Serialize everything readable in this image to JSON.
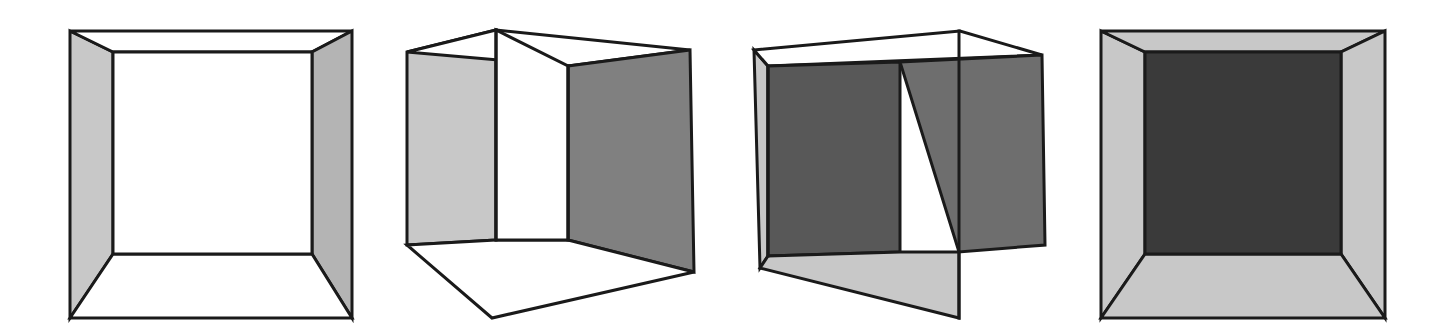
{
  "figure": {
    "background_color": "#ffffff",
    "canvas": {
      "width": 1443,
      "height": 336
    },
    "stroke_color": "#1a1a1a",
    "stroke_width": 3,
    "palette": {
      "white": "#ffffff",
      "light_gray": "#c8c8c8",
      "mid_gray": "#b4b4b4",
      "medium_gray": "#808080",
      "dark_gray": "#6e6e6e",
      "very_dark_gray": "#3a3a3a"
    }
  },
  "cubes": [
    {
      "id": "cube-1",
      "label": "Frontal open box, white back face",
      "view": "one-point-perspective-frontal",
      "bounds": {
        "x": 70,
        "y": 31,
        "width": 282,
        "height": 287
      },
      "faces": [
        {
          "name": "left-wall",
          "fill": "#c8c8c8",
          "points": "70,31 113,52 113,254 70,318"
        },
        {
          "name": "top-wall",
          "fill": "#ffffff",
          "points": "70,31 352,31 312,52 113,52"
        },
        {
          "name": "right-wall",
          "fill": "#b4b4b4",
          "points": "352,31 352,318 312,254 312,52"
        },
        {
          "name": "bottom-wall",
          "fill": "#ffffff",
          "points": "70,318 113,254 312,254 352,318"
        },
        {
          "name": "back-face",
          "fill": "#ffffff",
          "points": "113,52 312,52 312,254 113,254"
        }
      ]
    },
    {
      "id": "cube-2",
      "label": "Three-quarter box, near edge left of centre, white floor and back",
      "view": "two-point-perspective-left",
      "bounds": {
        "x": 407,
        "y": 30,
        "width": 287,
        "height": 288
      },
      "faces": [
        {
          "name": "left-wall",
          "fill": "#c8c8c8",
          "points": "407,52 496,30 496,240 407,245"
        },
        {
          "name": "top-wall",
          "fill": "#ffffff",
          "points": "496,30 690,50 568,66 407,52"
        },
        {
          "name": "right-wall",
          "fill": "#808080",
          "points": "568,66 690,50 694,272 568,240"
        },
        {
          "name": "floor",
          "fill": "#ffffff",
          "points": "407,245 496,240 568,240 694,272 492,318"
        },
        {
          "name": "back-face",
          "fill": "#ffffff",
          "points": "496,30 568,66 568,240 496,240"
        }
      ],
      "interior_edges": [
        {
          "name": "near-vertical-edge",
          "from": [
            496,
            30
          ],
          "to": [
            496,
            240
          ]
        },
        {
          "name": "back-vertical-edge",
          "from": [
            568,
            66
          ],
          "to": [
            568,
            240
          ]
        }
      ]
    },
    {
      "id": "cube-3",
      "label": "Three-quarter box mirrored, near edge right of centre, dark back face",
      "view": "two-point-perspective-right",
      "bounds": {
        "x": 754,
        "y": 31,
        "width": 291,
        "height": 287
      },
      "faces": [
        {
          "name": "left-wall",
          "fill": "#c8c8c8",
          "points": "754,50 768,66 768,256 760,268"
        },
        {
          "name": "top-wall",
          "fill": "#ffffff",
          "points": "754,50 960,31 1042,55 768,66"
        },
        {
          "name": "back-face",
          "fill": "#585858",
          "points": "768,66 900,62 900,252 768,256"
        },
        {
          "name": "right-wall",
          "fill": "#6e6e6e",
          "points": "900,62 1042,55 1045,245 959,252"
        },
        {
          "name": "floor",
          "fill": "#c8c8c8",
          "points": "760,268 768,256 900,252 959,252 959,318"
        }
      ],
      "interior_edges": [
        {
          "name": "near-vertical-edge",
          "from": [
            959,
            31
          ],
          "to": [
            959,
            318
          ]
        },
        {
          "name": "back-left-vertical-edge",
          "from": [
            768,
            66
          ],
          "to": [
            768,
            256
          ]
        }
      ]
    },
    {
      "id": "cube-4",
      "label": "Frontal open box, very dark back face, all four walls shaded",
      "view": "one-point-perspective-frontal",
      "bounds": {
        "x": 1101,
        "y": 31,
        "width": 284,
        "height": 287
      },
      "faces": [
        {
          "name": "left-wall",
          "fill": "#c8c8c8",
          "points": "1101,31 1145,52 1145,254 1101,318"
        },
        {
          "name": "top-wall",
          "fill": "#c8c8c8",
          "points": "1101,31 1385,31 1341,52 1145,52"
        },
        {
          "name": "right-wall",
          "fill": "#c8c8c8",
          "points": "1385,31 1385,318 1341,254 1341,52"
        },
        {
          "name": "bottom-wall",
          "fill": "#c8c8c8",
          "points": "1101,318 1145,254 1341,254 1385,318"
        },
        {
          "name": "back-face",
          "fill": "#3a3a3a",
          "points": "1145,52 1341,52 1341,254 1145,254"
        }
      ]
    }
  ]
}
